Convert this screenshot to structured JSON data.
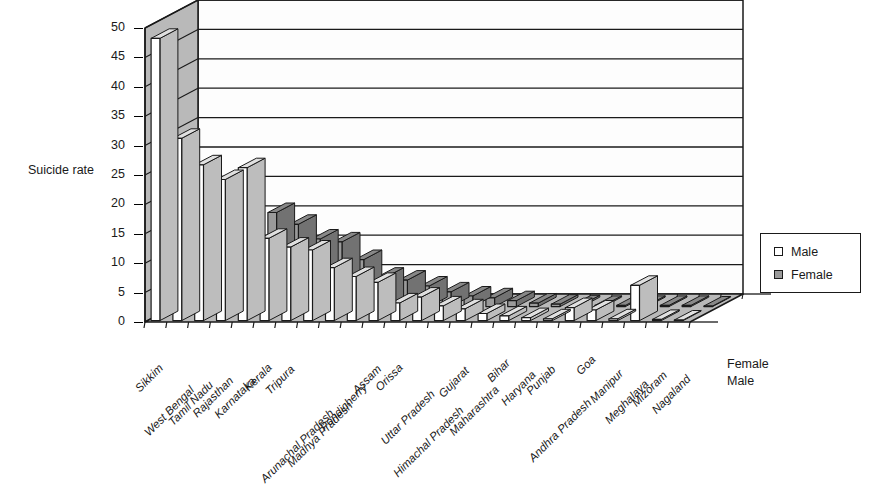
{
  "chart_data": {
    "type": "bar",
    "title": "",
    "subtitle": "",
    "xlabel": "",
    "ylabel": "Suicide rate",
    "zlabels": [
      "Male",
      "Female"
    ],
    "ylim": [
      0,
      50
    ],
    "ytick_step": 5,
    "yticks": [
      "50",
      "45",
      "40",
      "35",
      "30",
      "25",
      "20",
      "15",
      "10",
      "5",
      "0"
    ],
    "grid": true,
    "legend_position": "right",
    "projection": "3d",
    "categories": [
      "Sikkim",
      "West Bengal",
      "Tamil Nadu",
      "Rajasthan",
      "Karnataka",
      "Kerala",
      "Tripura",
      "Arunachal Pradesh",
      "Madhya Pradesh",
      "Pondicherry",
      "Assam",
      "Orissa",
      "Uttar Pradesh",
      "Himachal Pradesh",
      "Gujarat",
      "Maharashtra",
      "Bihar",
      "Haryana",
      "Punjab",
      "Andhra Pradesh",
      "Goa",
      "Manipur",
      "Meghalaya",
      "Mizoram",
      "Nagaland"
    ],
    "series": [
      {
        "name": "Male",
        "color": "#ffffff",
        "values": [
          48,
          31,
          26.5,
          24,
          26,
          14,
          12.5,
          12,
          9,
          7.5,
          6.5,
          3,
          4,
          2.5,
          2,
          1.2,
          0.8,
          0.5,
          0.3,
          2.2,
          1.8,
          0.3,
          6,
          0.2,
          0.1
        ]
      },
      {
        "name": "Female",
        "color": "#9a9a9a",
        "values": [
          0.8,
          17,
          12,
          8.5,
          16,
          14,
          11.5,
          11,
          8,
          5,
          4.5,
          3.5,
          2.5,
          1.8,
          1.5,
          1,
          0.6,
          0.4,
          0.3,
          0.2,
          0.2,
          0.2,
          0.2,
          0.2,
          0.1
        ]
      }
    ]
  },
  "legend": {
    "items": [
      {
        "label": "Male"
      },
      {
        "label": "Female"
      }
    ]
  }
}
